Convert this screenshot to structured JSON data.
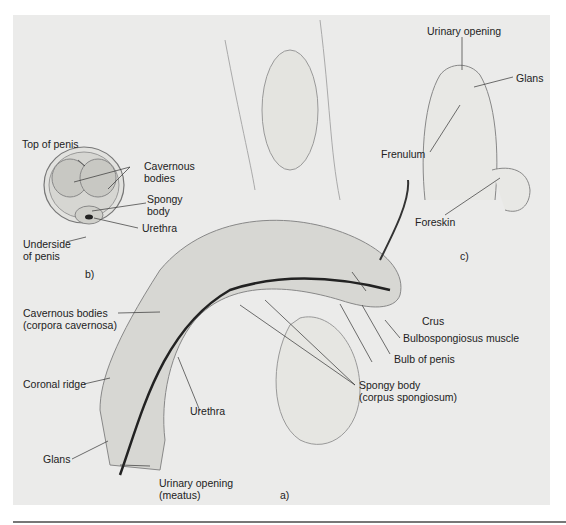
{
  "figure": {
    "panels": {
      "a": "a)",
      "b": "b)",
      "c": "c)"
    },
    "cross_section_b": {
      "top": "Top of penis",
      "cavernous": [
        "Cavernous",
        "bodies"
      ],
      "spongy": [
        "Spongy",
        "body"
      ],
      "urethra": "Urethra",
      "underside": [
        "Underside",
        "of penis"
      ]
    },
    "external_c": {
      "urinary_opening": "Urinary opening",
      "glans": "Glans",
      "frenulum": "Frenulum",
      "foreskin": "Foreskin"
    },
    "sagittal_a": {
      "cavernous": [
        "Cavernous bodies",
        "(corpora cavernosa)"
      ],
      "coronal_ridge": "Coronal ridge",
      "glans": "Glans",
      "urinary_opening": [
        "Urinary opening",
        "(meatus)"
      ],
      "urethra": "Urethra",
      "crus": "Crus",
      "bulbospongiosus": "Bulbospongiosus muscle",
      "bulb": "Bulb of penis",
      "spongy": [
        "Spongy body",
        "(corpus spongiosum)"
      ]
    }
  }
}
